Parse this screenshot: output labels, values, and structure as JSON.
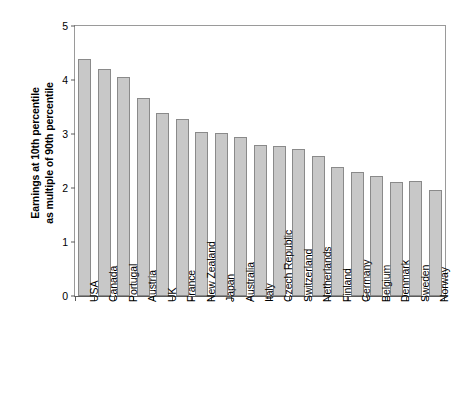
{
  "chart_data": {
    "type": "bar",
    "title": "",
    "xlabel": "",
    "ylabel": "Earnings at 10th percentile as multiple of 90th percentile",
    "ylabel_line1": "Earnings at 10th percentile",
    "ylabel_line2": "as multiple of 90th percentile",
    "ylim": [
      0,
      5
    ],
    "yticks": [
      0,
      1,
      2,
      3,
      4,
      5
    ],
    "ytick_labels": [
      "0",
      "1",
      "2",
      "3",
      "4",
      "5"
    ],
    "grid": false,
    "legend": false,
    "bar_color": "#c8c8c8",
    "bar_edge_color": "#8a8a8a",
    "axis_color": "#5b5b5b",
    "categories": [
      "USA",
      "Canada",
      "Portugal",
      "Austria",
      "UK",
      "France",
      "New Zealand",
      "Japan",
      "Australia",
      "Italy",
      "Czech Republic",
      "Switzerland",
      "Netherlands",
      "Finland",
      "Germany",
      "Belgium",
      "Denmark",
      "Sweden",
      "Norway"
    ],
    "values": [
      4.39,
      4.2,
      4.05,
      3.66,
      3.38,
      3.27,
      3.04,
      3.02,
      2.95,
      2.8,
      2.78,
      2.72,
      2.59,
      2.39,
      2.3,
      2.22,
      2.11,
      2.13,
      1.96
    ]
  }
}
